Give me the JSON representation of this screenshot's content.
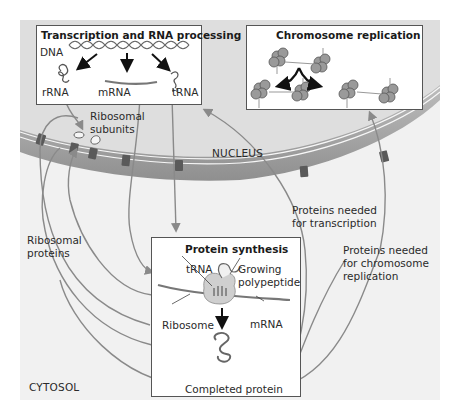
{
  "diagram": {
    "colors": {
      "background": "#ffffff",
      "cytosol": "#f1f1f1",
      "nucleus": "#dcdcdc",
      "membrane": "#a9a9a9",
      "arrow": "#8a8a8a",
      "pore": "#555555",
      "box_border": "#555555"
    },
    "compartments": {
      "nucleus_label": "NUCLEUS",
      "cytosol_label": "CYTOSOL"
    },
    "transcription_box": {
      "title": "Transcription and RNA processing",
      "dna_label": "DNA",
      "products": [
        "rRNA",
        "mRNA",
        "tRNA"
      ]
    },
    "replication_box": {
      "title": "Chromosome replication"
    },
    "protein_synthesis_box": {
      "title": "Protein synthesis",
      "labels": {
        "trna": "tRNA",
        "growing": "Growing",
        "polypeptide": "polypeptide",
        "ribosome": "Ribosome",
        "mrna": "mRNA",
        "completed": "Completed protein"
      }
    },
    "annotations": {
      "ribosomal_subunits_1": "Ribosomal",
      "ribosomal_subunits_2": "subunits",
      "ribosomal_proteins_1": "Ribosomal",
      "ribosomal_proteins_2": "proteins",
      "transcription_proteins_1": "Proteins needed",
      "transcription_proteins_2": "for transcription",
      "replication_proteins_1": "Proteins needed",
      "replication_proteins_2": "for chromosome",
      "replication_proteins_3": "replication"
    }
  }
}
